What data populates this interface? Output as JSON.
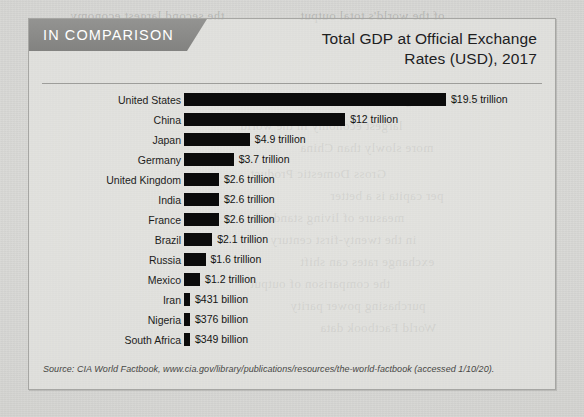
{
  "banner": {
    "label": "IN COMPARISON"
  },
  "title": {
    "line1": "Total GDP at Official Exchange",
    "line2": "Rates (USD), 2017"
  },
  "source": {
    "text": "Source: CIA World Factbook, www.cia.gov/library/publications/resources/the-world-factbook (accessed 1/10/20)."
  },
  "colors": {
    "banner_gray": "#8a8a88",
    "bar_black": "#0b0b0b",
    "page_background": "#d8d8d5",
    "box_border": "#a6a6a3",
    "rule": "#9d9d9a",
    "title_text": "#20201f"
  },
  "chart_data": {
    "type": "bar",
    "orientation": "horizontal",
    "title": "Total GDP at Official Exchange Rates (USD), 2017",
    "xlabel": "",
    "ylabel": "",
    "unit": "USD",
    "grid": false,
    "legend": null,
    "axis_visible": false,
    "value_labels_shown": true,
    "sort_order": "descending",
    "xlim": [
      0,
      19.5
    ],
    "categories": [
      "United States",
      "China",
      "Japan",
      "Germany",
      "United Kingdom",
      "India",
      "France",
      "Brazil",
      "Russia",
      "Mexico",
      "Iran",
      "Nigeria",
      "South Africa"
    ],
    "values_trillions_usd": [
      19.5,
      12,
      4.9,
      3.7,
      2.6,
      2.6,
      2.6,
      2.1,
      1.6,
      1.2,
      0.431,
      0.376,
      0.349
    ],
    "value_labels": [
      "$19.5 trillion",
      "$12 trillion",
      "$4.9 trillion",
      "$3.7 trillion",
      "$2.6 trillion",
      "$2.6 trillion",
      "$2.6 trillion",
      "$2.1 trillion",
      "$1.6 trillion",
      "$1.2 trillion",
      "$431 billion",
      "$376 billion",
      "$349 billion"
    ],
    "bars": [
      {
        "category": "United States",
        "value": 19.5,
        "label": "$19.5 trillion"
      },
      {
        "category": "China",
        "value": 12,
        "label": "$12 trillion"
      },
      {
        "category": "Japan",
        "value": 4.9,
        "label": "$4.9 trillion"
      },
      {
        "category": "Germany",
        "value": 3.7,
        "label": "$3.7 trillion"
      },
      {
        "category": "United Kingdom",
        "value": 2.6,
        "label": "$2.6 trillion"
      },
      {
        "category": "India",
        "value": 2.6,
        "label": "$2.6 trillion"
      },
      {
        "category": "France",
        "value": 2.6,
        "label": "$2.6 trillion"
      },
      {
        "category": "Brazil",
        "value": 2.1,
        "label": "$2.1 trillion"
      },
      {
        "category": "Russia",
        "value": 1.6,
        "label": "$1.6 trillion"
      },
      {
        "category": "Mexico",
        "value": 1.2,
        "label": "$1.2 trillion"
      },
      {
        "category": "Iran",
        "value": 0.431,
        "label": "$431 billion"
      },
      {
        "category": "Nigeria",
        "value": 0.376,
        "label": "$376 billion"
      },
      {
        "category": "South Africa",
        "value": 0.349,
        "label": "$349 billion"
      }
    ]
  },
  "background_bleed": [
    {
      "text": "the second largest economy",
      "left": 70,
      "top": 8
    },
    {
      "text": "of the world's total output",
      "left": 300,
      "top": 8
    },
    {
      "text": "2019, it had grown to more",
      "left": 330,
      "top": 92
    },
    {
      "text": "largest economy in the world",
      "left": 240,
      "top": 118
    },
    {
      "text": "more slowly than China",
      "left": 300,
      "top": 140
    },
    {
      "text": "Gross Domestic Product",
      "left": 250,
      "top": 166
    },
    {
      "text": "per capita is a better",
      "left": 330,
      "top": 188
    },
    {
      "text": "measure of living standards",
      "left": 250,
      "top": 210
    },
    {
      "text": "in the twenty-first century",
      "left": 270,
      "top": 232
    },
    {
      "text": "exchange rates can shift",
      "left": 300,
      "top": 254
    },
    {
      "text": "the comparison of output",
      "left": 250,
      "top": 276
    },
    {
      "text": "purchasing power parity",
      "left": 290,
      "top": 298
    },
    {
      "text": "World Factbook data",
      "left": 320,
      "top": 320
    }
  ]
}
